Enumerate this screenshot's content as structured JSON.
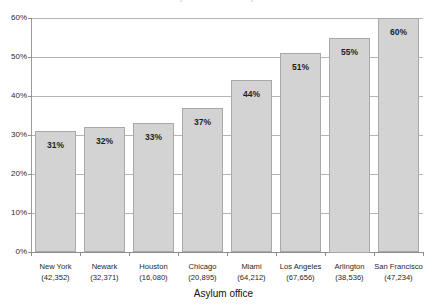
{
  "clipped_title": "Asylum denial rates by office",
  "chart_data": {
    "type": "bar",
    "title": "",
    "xlabel": "Asylum office",
    "ylabel": "",
    "ylim": [
      0,
      60
    ],
    "yticks": [
      "0%",
      "10%",
      "20%",
      "30%",
      "40%",
      "50%",
      "60%"
    ],
    "ytick_values": [
      0,
      10,
      20,
      30,
      40,
      50,
      60
    ],
    "grid": true,
    "legend": "none",
    "categories": [
      "New York",
      "Newark",
      "Houston",
      "Chicago",
      "Miami",
      "Los Angeles",
      "Arlington",
      "San Francisco"
    ],
    "category_counts": [
      "(42,352)",
      "(32,371)",
      "(16,080)",
      "(20,895)",
      "(64,212)",
      "(67,656)",
      "(38,536)",
      "(47,234)"
    ],
    "values": [
      31,
      32,
      33,
      37,
      44,
      51,
      55,
      60
    ],
    "value_labels": [
      "31%",
      "32%",
      "33%",
      "37%",
      "44%",
      "51%",
      "55%",
      "60%"
    ],
    "bar_color": "#d3d3d3",
    "bar_border_color": "#a8a8a8",
    "grid_color": "#b4b4b4",
    "axis_color": "#8d8d8d"
  }
}
